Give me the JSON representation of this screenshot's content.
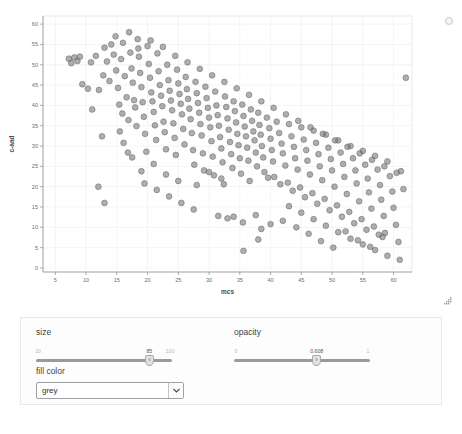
{
  "plot": {
    "xlabel": "mcs",
    "ylabel": "c-aad",
    "refresh_icon": "busy-indicator-icon",
    "resize_icon": "resize-grip-icon"
  },
  "controls": {
    "size": {
      "label": "size",
      "min_label": "10",
      "max_label": "100",
      "value_label": "85",
      "min": 10,
      "max": 100,
      "value": 85
    },
    "opacity": {
      "label": "opacity",
      "min_label": "0",
      "max_label": "1",
      "value_label": "0.608",
      "min": 0,
      "max": 1,
      "value": 0.608
    },
    "fill_color": {
      "label": "fill color",
      "value": "grey",
      "options": [
        "grey"
      ],
      "arrow_icon": "chevron-down-icon"
    }
  },
  "colors": {
    "point_fill": "#7a7a7a",
    "point_stroke": "#5c5c5c",
    "grid": "#ececf0",
    "axis": "#8a8a8a",
    "panel_bg": "#fdfdfd"
  },
  "chart_data": {
    "type": "scatter",
    "title": "",
    "xlabel": "mcs",
    "ylabel": "c-aad",
    "xlim": [
      3,
      63
    ],
    "ylim": [
      -1,
      62
    ],
    "xticks": [
      5,
      10,
      15,
      20,
      25,
      30,
      35,
      40,
      45,
      50,
      55,
      60
    ],
    "yticks": [
      0,
      5,
      10,
      15,
      20,
      25,
      30,
      35,
      40,
      45,
      50,
      55,
      60
    ],
    "grid": true,
    "legend": "none",
    "marker": {
      "shape": "circle",
      "fill": "#7a7a7a",
      "stroke": "#5c5c5c",
      "opacity": 0.608,
      "size": 85
    },
    "points": [
      [
        7.2,
        51.5
      ],
      [
        7.6,
        50.4
      ],
      [
        8.1,
        51.8
      ],
      [
        8.6,
        50.9
      ],
      [
        9.4,
        45.2
      ],
      [
        10.3,
        44.1
      ],
      [
        11.0,
        39.0
      ],
      [
        12.1,
        43.8
      ],
      [
        12.6,
        32.4
      ],
      [
        13.4,
        50.8
      ],
      [
        13.8,
        46.0
      ],
      [
        14.1,
        55.0
      ],
      [
        14.5,
        52.5
      ],
      [
        14.9,
        48.6
      ],
      [
        15.2,
        44.3
      ],
      [
        15.4,
        40.2
      ],
      [
        15.7,
        51.4
      ],
      [
        15.9,
        38.0
      ],
      [
        16.1,
        30.8
      ],
      [
        16.3,
        47.2
      ],
      [
        16.6,
        42.0
      ],
      [
        16.9,
        36.4
      ],
      [
        17.2,
        53.0
      ],
      [
        17.4,
        49.1
      ],
      [
        17.6,
        45.6
      ],
      [
        17.8,
        41.3
      ],
      [
        18.0,
        39.5
      ],
      [
        18.2,
        34.9
      ],
      [
        18.4,
        56.3
      ],
      [
        18.6,
        52.0
      ],
      [
        18.8,
        48.0
      ],
      [
        19.0,
        44.5
      ],
      [
        19.2,
        40.8
      ],
      [
        19.4,
        37.2
      ],
      [
        19.6,
        33.0
      ],
      [
        19.8,
        28.6
      ],
      [
        20.0,
        54.6
      ],
      [
        20.2,
        50.2
      ],
      [
        20.4,
        46.8
      ],
      [
        20.6,
        43.2
      ],
      [
        20.8,
        41.0
      ],
      [
        21.0,
        38.4
      ],
      [
        21.2,
        35.1
      ],
      [
        21.4,
        31.5
      ],
      [
        21.6,
        52.8
      ],
      [
        21.8,
        48.4
      ],
      [
        22.0,
        45.0
      ],
      [
        22.2,
        42.4
      ],
      [
        22.4,
        39.8
      ],
      [
        22.6,
        36.0
      ],
      [
        22.8,
        33.4
      ],
      [
        23.0,
        29.2
      ],
      [
        23.2,
        50.0
      ],
      [
        23.4,
        46.2
      ],
      [
        23.6,
        43.6
      ],
      [
        23.8,
        41.2
      ],
      [
        24.0,
        38.8
      ],
      [
        24.2,
        35.6
      ],
      [
        24.4,
        32.0
      ],
      [
        24.6,
        27.8
      ],
      [
        24.8,
        48.8
      ],
      [
        25.0,
        45.4
      ],
      [
        25.2,
        42.8
      ],
      [
        25.4,
        40.4
      ],
      [
        25.6,
        37.8
      ],
      [
        25.8,
        34.2
      ],
      [
        26.0,
        30.4
      ],
      [
        26.2,
        47.0
      ],
      [
        26.4,
        44.0
      ],
      [
        26.6,
        41.6
      ],
      [
        26.8,
        39.2
      ],
      [
        27.0,
        36.6
      ],
      [
        27.2,
        33.2
      ],
      [
        27.4,
        29.0
      ],
      [
        27.6,
        25.4
      ],
      [
        27.8,
        45.8
      ],
      [
        28.0,
        43.0
      ],
      [
        28.2,
        40.6
      ],
      [
        28.4,
        38.2
      ],
      [
        28.6,
        35.4
      ],
      [
        28.8,
        32.6
      ],
      [
        29.0,
        28.2
      ],
      [
        29.2,
        24.0
      ],
      [
        29.4,
        44.6
      ],
      [
        29.6,
        41.8
      ],
      [
        29.8,
        39.4
      ],
      [
        30.0,
        37.0
      ],
      [
        30.2,
        34.6
      ],
      [
        30.4,
        31.2
      ],
      [
        30.6,
        27.4
      ],
      [
        30.8,
        22.8
      ],
      [
        31.0,
        43.4
      ],
      [
        31.2,
        40.0
      ],
      [
        31.4,
        37.6
      ],
      [
        31.6,
        35.0
      ],
      [
        31.8,
        32.2
      ],
      [
        32.0,
        29.4
      ],
      [
        32.2,
        26.0
      ],
      [
        32.4,
        20.6
      ],
      [
        32.6,
        42.2
      ],
      [
        32.8,
        39.6
      ],
      [
        33.0,
        36.8
      ],
      [
        33.2,
        34.0
      ],
      [
        33.4,
        31.0
      ],
      [
        33.6,
        28.0
      ],
      [
        33.8,
        24.6
      ],
      [
        34.0,
        41.0
      ],
      [
        34.2,
        38.6
      ],
      [
        34.4,
        35.8
      ],
      [
        34.6,
        33.0
      ],
      [
        34.8,
        30.2
      ],
      [
        35.0,
        27.0
      ],
      [
        35.2,
        23.2
      ],
      [
        35.4,
        40.2
      ],
      [
        35.6,
        37.4
      ],
      [
        35.8,
        34.8
      ],
      [
        36.0,
        32.4
      ],
      [
        36.2,
        29.6
      ],
      [
        36.4,
        26.4
      ],
      [
        36.6,
        21.4
      ],
      [
        36.8,
        39.0
      ],
      [
        37.0,
        36.2
      ],
      [
        37.2,
        33.6
      ],
      [
        37.4,
        31.4
      ],
      [
        37.6,
        28.4
      ],
      [
        37.8,
        25.0
      ],
      [
        38.0,
        38.2
      ],
      [
        38.2,
        35.2
      ],
      [
        38.4,
        32.8
      ],
      [
        38.6,
        30.0
      ],
      [
        38.8,
        27.2
      ],
      [
        39.0,
        23.6
      ],
      [
        39.4,
        37.0
      ],
      [
        39.8,
        34.4
      ],
      [
        40.0,
        31.8
      ],
      [
        40.2,
        29.0
      ],
      [
        40.4,
        26.2
      ],
      [
        40.6,
        22.4
      ],
      [
        41.0,
        36.0
      ],
      [
        41.4,
        33.2
      ],
      [
        41.8,
        30.6
      ],
      [
        42.0,
        28.2
      ],
      [
        42.4,
        25.2
      ],
      [
        42.8,
        21.0
      ],
      [
        43.0,
        35.4
      ],
      [
        43.4,
        32.4
      ],
      [
        43.8,
        29.8
      ],
      [
        44.0,
        27.0
      ],
      [
        44.4,
        24.2
      ],
      [
        44.8,
        19.8
      ],
      [
        45.0,
        34.6
      ],
      [
        45.4,
        31.6
      ],
      [
        45.8,
        29.0
      ],
      [
        46.0,
        26.4
      ],
      [
        46.4,
        23.0
      ],
      [
        46.8,
        18.4
      ],
      [
        47.0,
        33.8
      ],
      [
        47.4,
        30.8
      ],
      [
        47.8,
        28.0
      ],
      [
        48.0,
        25.0
      ],
      [
        48.4,
        21.6
      ],
      [
        48.8,
        17.0
      ],
      [
        49.0,
        32.8
      ],
      [
        49.4,
        29.6
      ],
      [
        49.8,
        26.8
      ],
      [
        50.0,
        24.0
      ],
      [
        50.4,
        20.0
      ],
      [
        50.8,
        15.4
      ],
      [
        51.0,
        31.4
      ],
      [
        51.4,
        28.4
      ],
      [
        51.8,
        25.6
      ],
      [
        52.0,
        22.4
      ],
      [
        52.4,
        18.2
      ],
      [
        52.8,
        13.8
      ],
      [
        53.0,
        30.0
      ],
      [
        53.4,
        27.0
      ],
      [
        53.8,
        24.0
      ],
      [
        54.0,
        20.8
      ],
      [
        54.4,
        16.4
      ],
      [
        54.8,
        12.0
      ],
      [
        55.0,
        28.8
      ],
      [
        55.4,
        25.4
      ],
      [
        55.8,
        22.0
      ],
      [
        56.0,
        18.6
      ],
      [
        56.4,
        14.6
      ],
      [
        56.8,
        10.2
      ],
      [
        57.0,
        27.6
      ],
      [
        57.4,
        24.2
      ],
      [
        57.8,
        20.4
      ],
      [
        58.0,
        16.8
      ],
      [
        58.4,
        12.8
      ],
      [
        58.6,
        8.6
      ],
      [
        59.0,
        26.2
      ],
      [
        59.4,
        22.6
      ],
      [
        59.8,
        18.8
      ],
      [
        60.0,
        14.8
      ],
      [
        60.4,
        10.6
      ],
      [
        60.8,
        6.4
      ],
      [
        61.2,
        23.8
      ],
      [
        61.6,
        19.4
      ],
      [
        62.0,
        46.8
      ],
      [
        9.0,
        52.0
      ],
      [
        10.8,
        50.6
      ],
      [
        11.6,
        52.2
      ],
      [
        12.8,
        47.4
      ],
      [
        13.0,
        54.2
      ],
      [
        14.8,
        57.0
      ],
      [
        16.0,
        55.4
      ],
      [
        17.0,
        58.0
      ],
      [
        18.5,
        54.0
      ],
      [
        20.5,
        56.0
      ],
      [
        22.5,
        54.4
      ],
      [
        24.5,
        52.2
      ],
      [
        26.5,
        50.6
      ],
      [
        28.5,
        49.0
      ],
      [
        30.5,
        47.4
      ],
      [
        32.5,
        45.8
      ],
      [
        34.5,
        44.2
      ],
      [
        36.5,
        42.6
      ],
      [
        38.5,
        41.0
      ],
      [
        40.5,
        39.4
      ],
      [
        42.5,
        37.8
      ],
      [
        44.5,
        36.2
      ],
      [
        46.5,
        34.6
      ],
      [
        48.5,
        33.0
      ],
      [
        50.5,
        31.4
      ],
      [
        52.5,
        29.8
      ],
      [
        54.5,
        28.2
      ],
      [
        56.5,
        26.6
      ],
      [
        58.5,
        25.0
      ],
      [
        60.5,
        23.4
      ],
      [
        19.5,
        20.8
      ],
      [
        21.5,
        19.2
      ],
      [
        23.5,
        17.6
      ],
      [
        25.5,
        16.0
      ],
      [
        27.5,
        14.4
      ],
      [
        31.5,
        12.8
      ],
      [
        35.5,
        11.2
      ],
      [
        38.5,
        9.6
      ],
      [
        21.0,
        25.6
      ],
      [
        23.0,
        23.0
      ],
      [
        25.0,
        21.4
      ],
      [
        17.5,
        27.2
      ],
      [
        19.0,
        23.8
      ],
      [
        15.5,
        33.6
      ],
      [
        16.8,
        28.4
      ],
      [
        43.0,
        15.2
      ],
      [
        45.0,
        13.6
      ],
      [
        47.0,
        12.0
      ],
      [
        49.0,
        10.4
      ],
      [
        51.0,
        8.8
      ],
      [
        53.0,
        7.2
      ],
      [
        55.0,
        5.8
      ],
      [
        57.0,
        4.4
      ],
      [
        59.0,
        3.0
      ],
      [
        61.0,
        2.0
      ],
      [
        54.2,
        6.8
      ],
      [
        56.2,
        5.2
      ],
      [
        58.2,
        7.6
      ],
      [
        55.6,
        9.4
      ],
      [
        57.6,
        8.2
      ],
      [
        53.6,
        11.0
      ],
      [
        51.6,
        12.6
      ],
      [
        49.6,
        14.2
      ],
      [
        47.6,
        15.8
      ],
      [
        45.6,
        17.4
      ],
      [
        43.6,
        19.0
      ],
      [
        41.6,
        20.6
      ],
      [
        39.6,
        22.2
      ],
      [
        37.6,
        13.0
      ],
      [
        35.6,
        4.2
      ],
      [
        33.0,
        12.2
      ],
      [
        34.0,
        12.6
      ],
      [
        44.2,
        10.0
      ],
      [
        46.2,
        8.4
      ],
      [
        48.2,
        6.6
      ],
      [
        50.2,
        5.0
      ],
      [
        52.2,
        9.0
      ],
      [
        40.0,
        10.8
      ],
      [
        42.0,
        11.6
      ],
      [
        38.0,
        7.0
      ],
      [
        12.0,
        20.0
      ],
      [
        13.0,
        16.0
      ],
      [
        30.0,
        23.6
      ],
      [
        32.0,
        22.0
      ],
      [
        28.0,
        20.4
      ]
    ]
  }
}
